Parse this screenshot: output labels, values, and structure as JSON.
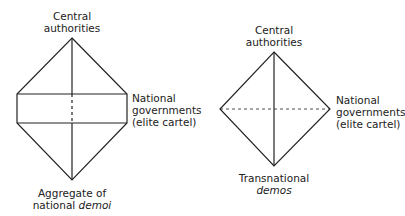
{
  "diagrams": [
    {
      "id": "left",
      "top_label": [
        "Central",
        "authorities"
      ],
      "side_label": [
        "National",
        "governments",
        "(elite cartel)"
      ],
      "bottom_label": {
        "line1": "Aggregate of",
        "line2_prefix": "national ",
        "line2_italic": "demoi"
      }
    },
    {
      "id": "right",
      "top_label": [
        "Central",
        "authorities"
      ],
      "side_label": [
        "National",
        "governments",
        "(elite cartel)"
      ],
      "bottom_label": {
        "line1": "Transnational",
        "line2_prefix": "",
        "line2_italic": "demos"
      }
    }
  ],
  "colors": {
    "stroke": "#222222",
    "background": "#ffffff"
  }
}
